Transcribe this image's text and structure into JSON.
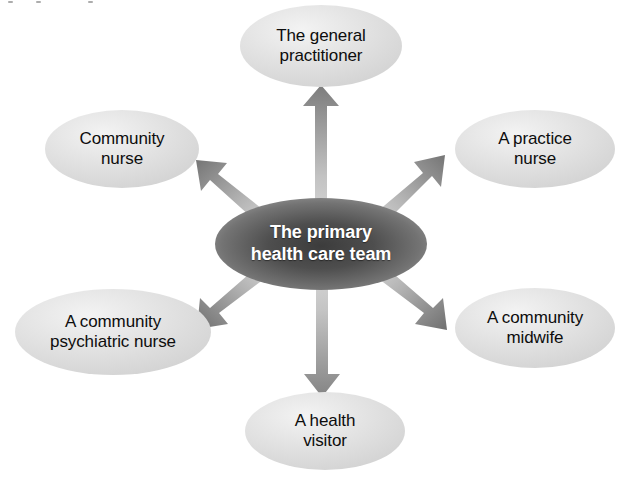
{
  "diagram": {
    "title": "The primary health care team",
    "type": "hub-and-spoke radial diagram",
    "background_color": "#ffffff",
    "center": {
      "id": "center-node",
      "label_line1": "The primary",
      "label_line2": "health care team",
      "full_label": "The primary health care team",
      "shape": "ellipse",
      "cx": 321,
      "cy": 244,
      "rx": 106,
      "ry": 46,
      "fill_center_color": "#464646",
      "fill_edge_color": "#909090",
      "text_color": "#ffffff",
      "font_weight": "bold",
      "font_size_px": 18
    },
    "spokes": [
      {
        "id": "node-general-practitioner",
        "label_line1": "The general",
        "label_line2": "practitioner",
        "full_label": "The general practitioner",
        "position": "top",
        "cx": 321,
        "cy": 46,
        "rx": 81,
        "ry": 41,
        "fill_color": "#dedede",
        "highlight_color": "#f2f2f2",
        "text_color": "#0d0d0d"
      },
      {
        "id": "node-practice-nurse",
        "label_line1": "A practice",
        "label_line2": "nurse",
        "full_label": "A practice nurse",
        "position": "top-right",
        "cx": 535,
        "cy": 149,
        "rx": 80,
        "ry": 39,
        "fill_color": "#dedede",
        "highlight_color": "#f2f2f2",
        "text_color": "#0d0d0d"
      },
      {
        "id": "node-community-midwife",
        "label_line1": "A community",
        "label_line2": "midwife",
        "full_label": "A community midwife",
        "position": "bottom-right",
        "cx": 535,
        "cy": 328,
        "rx": 80,
        "ry": 40,
        "fill_color": "#dedede",
        "highlight_color": "#f2f2f2",
        "text_color": "#0d0d0d"
      },
      {
        "id": "node-health-visitor",
        "label_line1": "A health",
        "label_line2": "visitor",
        "full_label": "A health visitor",
        "position": "bottom",
        "cx": 325,
        "cy": 431,
        "rx": 80,
        "ry": 39,
        "fill_color": "#dedede",
        "highlight_color": "#f2f2f2",
        "text_color": "#0d0d0d"
      },
      {
        "id": "node-community-psychiatric-nurse",
        "label_line1": "A community",
        "label_line2": "psychiatric nurse",
        "full_label": "A community psychiatric nurse",
        "position": "bottom-left",
        "cx": 113,
        "cy": 332,
        "rx": 98,
        "ry": 43,
        "fill_color": "#dedede",
        "highlight_color": "#f2f2f2",
        "text_color": "#0d0d0d"
      },
      {
        "id": "node-community-nurse",
        "label_line1": "Community",
        "label_line2": "nurse",
        "full_label": "Community nurse",
        "position": "top-left",
        "cx": 122,
        "cy": 149,
        "rx": 77,
        "ry": 39,
        "fill_color": "#dedede",
        "highlight_color": "#f2f2f2",
        "text_color": "#0d0d0d"
      }
    ],
    "arrows": {
      "count": 6,
      "style": "gradient gray block arrows radiating outward from center",
      "head_color": "#7d7d7d",
      "tail_color": "#d6d6d6",
      "directions": [
        "up",
        "up-right",
        "down-right",
        "down",
        "down-left",
        "up-left"
      ]
    }
  }
}
